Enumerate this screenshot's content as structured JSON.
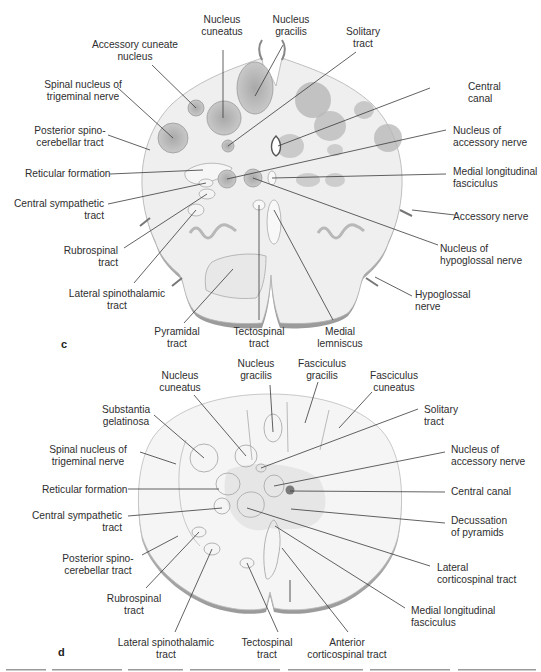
{
  "figure": {
    "panel_c": {
      "letter": "c",
      "labels": {
        "nucleus_cuneatus": [
          "Nucleus",
          "cuneatus"
        ],
        "nucleus_gracilis": [
          "Nucleus",
          "gracilis"
        ],
        "solitary_tract": [
          "Solitary",
          "tract"
        ],
        "accessory_cuneate_nucleus": [
          "Accessory cuneate",
          "nucleus"
        ],
        "spinal_nucleus_trigeminal": [
          "Spinal nucleus of",
          "trigeminal nerve"
        ],
        "central_canal": [
          "Central",
          "canal"
        ],
        "posterior_spinocerebellar": [
          "Posterior spino-",
          "cerebellar tract"
        ],
        "nucleus_accessory_nerve": [
          "Nucleus of",
          "accessory nerve"
        ],
        "reticular_formation": [
          "Reticular formation"
        ],
        "medial_longitudinal_fasciculus": [
          "Medial longitudinal",
          "fasciculus"
        ],
        "central_sympathetic": [
          "Central sympathetic",
          "tract"
        ],
        "accessory_nerve": [
          "Accessory nerve"
        ],
        "rubrospinal": [
          "Rubrospinal",
          "tract"
        ],
        "nucleus_hypoglossal": [
          "Nucleus of",
          "hypoglossal nerve"
        ],
        "lateral_spinothalamic": [
          "Lateral spinothalamic",
          "tract"
        ],
        "hypoglossal_nerve": [
          "Hypoglossal",
          "nerve"
        ],
        "pyramidal_tract": [
          "Pyramidal",
          "tract"
        ],
        "tectospinal_tract": [
          "Tectospinal",
          "tract"
        ],
        "medial_lemniscus": [
          "Medial",
          "lemniscus"
        ]
      }
    },
    "panel_d": {
      "letter": "d",
      "labels": {
        "nucleus_gracilis": [
          "Nucleus",
          "gracilis"
        ],
        "fasciculus_gracilis": [
          "Fasciculus",
          "gracilis"
        ],
        "nucleus_cuneatus": [
          "Nucleus",
          "cuneatus"
        ],
        "fasciculus_cuneatus": [
          "Fasciculus",
          "cuneatus"
        ],
        "substantia_gelatinosa": [
          "Substantia",
          "gelatinosa"
        ],
        "solitary_tract": [
          "Solitary",
          "tract"
        ],
        "spinal_nucleus_trigeminal": [
          "Spinal nucleus of",
          "trigeminal nerve"
        ],
        "nucleus_accessory_nerve": [
          "Nucleus of",
          "accessory nerve"
        ],
        "reticular_formation": [
          "Reticular formation"
        ],
        "central_canal": [
          "Central canal"
        ],
        "central_sympathetic": [
          "Central sympathetic",
          "tract"
        ],
        "decussation_pyramids": [
          "Decussation",
          "of pyramids"
        ],
        "posterior_spinocerebellar": [
          "Posterior spino-",
          "cerebellar tract"
        ],
        "lateral_corticospinal": [
          "Lateral",
          "corticospinal tract"
        ],
        "rubrospinal": [
          "Rubrospinal",
          "tract"
        ],
        "medial_longitudinal_fasciculus": [
          "Medial longitudinal",
          "fasciculus"
        ],
        "lateral_spinothalamic": [
          "Lateral spinothalamic",
          "tract"
        ],
        "tectospinal_tract": [
          "Tectospinal",
          "tract"
        ],
        "anterior_corticospinal": [
          "Anterior",
          "corticospinal tract"
        ]
      }
    }
  },
  "colors": {
    "outline": "#8a8a8a",
    "leader": "#3a3a3a",
    "nucleus_fill": "#b9b9b9",
    "tissue": "#eeeeee",
    "tissue_light": "#f6f6f6",
    "central_canal_d": "#7a7a7a"
  }
}
